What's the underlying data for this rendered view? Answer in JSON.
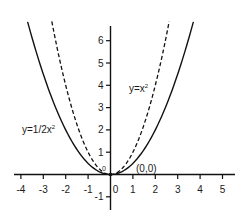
{
  "chart_data": {
    "type": "line",
    "title": "",
    "xlabel": "",
    "ylabel": "",
    "xlim": [
      -4.3,
      5.6
    ],
    "ylim": [
      -1.6,
      6.9
    ],
    "grid": false,
    "x_ticks": [
      -4,
      -3,
      -2,
      -1,
      0,
      1,
      2,
      3,
      4,
      5
    ],
    "y_ticks": [
      -1,
      1,
      2,
      3,
      4,
      5,
      6
    ],
    "x_tick_labels": [
      "-4",
      "-3",
      "-2",
      "-1",
      "0",
      "1",
      "2",
      "3",
      "4",
      "5"
    ],
    "y_tick_labels": [
      "-1",
      "1",
      "2",
      "3",
      "4",
      "5",
      "6"
    ],
    "series": [
      {
        "name": "y=1/2x²",
        "label_base": "y=1/2x",
        "label_sup": "2",
        "style": "solid",
        "color": "#111111",
        "x": [
          -3.7,
          -3,
          -2,
          -1,
          0,
          1,
          2,
          3,
          3.7
        ],
        "values": [
          6.85,
          4.5,
          2,
          0.5,
          0,
          0.5,
          2,
          4.5,
          6.85
        ]
      },
      {
        "name": "y=x²",
        "label_base": "y=x",
        "label_sup": "2",
        "style": "dashed",
        "color": "#111111",
        "x": [
          -2.62,
          -2,
          -1,
          0,
          1,
          2,
          2.62
        ],
        "values": [
          6.85,
          4,
          1,
          0,
          1,
          4,
          6.85
        ]
      }
    ],
    "annotations": [
      {
        "text": "(0,0)",
        "x": 0,
        "y": 0
      },
      {
        "text": "0",
        "note": "small origin label left of y-axis above x-axis"
      }
    ],
    "point": {
      "x": 0,
      "y": 0
    }
  }
}
